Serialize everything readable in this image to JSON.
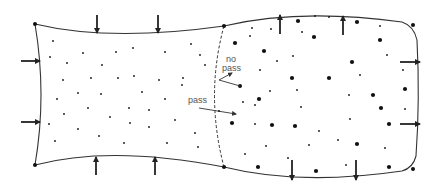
{
  "diagram": {
    "type": "membrane-compartments",
    "colors": {
      "stroke": "#333333",
      "particle": "#111111",
      "label": "#555555",
      "background": "#ffffff"
    },
    "labels": {
      "no_pass_line1": "no",
      "no_pass_line2": "pass",
      "pass": "pass"
    },
    "left_compartment": {
      "name": "compressed",
      "arrow_direction": "inward",
      "corner_points": [
        [
          35,
          24
        ],
        [
          35,
          165
        ]
      ],
      "small_particles": [
        [
          53,
          41
        ],
        [
          50,
          57
        ],
        [
          83,
          53
        ],
        [
          67,
          63
        ],
        [
          116,
          52
        ],
        [
          102,
          65
        ],
        [
          133,
          48
        ],
        [
          165,
          52
        ],
        [
          63,
          80
        ],
        [
          91,
          78
        ],
        [
          118,
          78
        ],
        [
          134,
          76
        ],
        [
          159,
          80
        ],
        [
          57,
          99
        ],
        [
          78,
          93
        ],
        [
          101,
          94
        ],
        [
          142,
          92
        ],
        [
          182,
          85
        ],
        [
          165,
          99
        ],
        [
          64,
          114
        ],
        [
          88,
          108
        ],
        [
          129,
          108
        ],
        [
          149,
          110
        ],
        [
          110,
          117
        ],
        [
          175,
          120
        ],
        [
          49,
          124
        ],
        [
          78,
          129
        ],
        [
          130,
          123
        ],
        [
          149,
          127
        ],
        [
          99,
          136
        ],
        [
          55,
          141
        ],
        [
          124,
          143
        ],
        [
          167,
          143
        ],
        [
          195,
          133
        ],
        [
          198,
          147
        ],
        [
          191,
          44
        ],
        [
          205,
          65
        ],
        [
          200,
          55
        ],
        [
          183,
          78
        ]
      ],
      "arrows": [
        {
          "x": 97,
          "y1": 15,
          "y2": 33,
          "dir": "down"
        },
        {
          "x": 158,
          "y1": 15,
          "y2": 33,
          "dir": "down"
        },
        {
          "y": 61,
          "x1": 21,
          "x2": 40,
          "dir": "right"
        },
        {
          "y": 122,
          "x1": 21,
          "x2": 40,
          "dir": "right"
        },
        {
          "x": 96,
          "y1": 175,
          "y2": 157,
          "dir": "up"
        },
        {
          "x": 155,
          "y1": 175,
          "y2": 157,
          "dir": "up"
        }
      ]
    },
    "right_compartment": {
      "name": "expanded",
      "arrow_direction": "outward",
      "large_particles": [
        [
          298,
          21
        ],
        [
          357,
          22
        ],
        [
          235,
          43
        ],
        [
          314,
          37
        ],
        [
          264,
          51
        ],
        [
          380,
          40
        ],
        [
          292,
          78
        ],
        [
          352,
          62
        ],
        [
          329,
          78
        ],
        [
          405,
          89
        ],
        [
          373,
          95
        ],
        [
          259,
          99
        ],
        [
          381,
          108
        ],
        [
          232,
          123
        ],
        [
          272,
          125
        ],
        [
          295,
          126
        ],
        [
          389,
          124
        ],
        [
          357,
          144
        ],
        [
          258,
          167
        ],
        [
          316,
          171
        ],
        [
          389,
          167
        ]
      ],
      "small_particles": [
        [
          252,
          28
        ],
        [
          271,
          29
        ],
        [
          315,
          16
        ],
        [
          329,
          17
        ],
        [
          380,
          26
        ],
        [
          302,
          32
        ],
        [
          250,
          36
        ],
        [
          293,
          56
        ],
        [
          387,
          55
        ],
        [
          260,
          70
        ],
        [
          277,
          61
        ],
        [
          360,
          75
        ],
        [
          403,
          70
        ],
        [
          270,
          91
        ],
        [
          297,
          90
        ],
        [
          349,
          95
        ],
        [
          301,
          107
        ],
        [
          405,
          109
        ],
        [
          243,
          102
        ],
        [
          255,
          105
        ],
        [
          255,
          124
        ],
        [
          350,
          119
        ],
        [
          319,
          131
        ],
        [
          338,
          140
        ],
        [
          266,
          146
        ],
        [
          309,
          145
        ],
        [
          385,
          148
        ],
        [
          245,
          154
        ],
        [
          288,
          158
        ],
        [
          346,
          165
        ]
      ],
      "arrows": [
        {
          "x": 280,
          "y1": 34,
          "y2": 15,
          "dir": "up"
        },
        {
          "x": 343,
          "y1": 35,
          "y2": 16,
          "dir": "up"
        },
        {
          "y": 62,
          "x1": 400,
          "x2": 420,
          "dir": "right"
        },
        {
          "y": 124,
          "x1": 400,
          "x2": 420,
          "dir": "right"
        },
        {
          "x": 292,
          "y1": 160,
          "y2": 180,
          "dir": "down"
        },
        {
          "x": 356,
          "y1": 160,
          "y2": 180,
          "dir": "down"
        }
      ]
    },
    "passage_examples": {
      "no_pass": {
        "particle": [
          240,
          86
        ],
        "path": [
          [
            240,
            86
          ],
          [
            219,
            80
          ],
          [
            232,
            74
          ]
        ]
      },
      "pass": {
        "particle": [
          219,
          111
        ],
        "path": [
          [
            199,
            108
          ],
          [
            235,
            114
          ]
        ]
      }
    }
  }
}
